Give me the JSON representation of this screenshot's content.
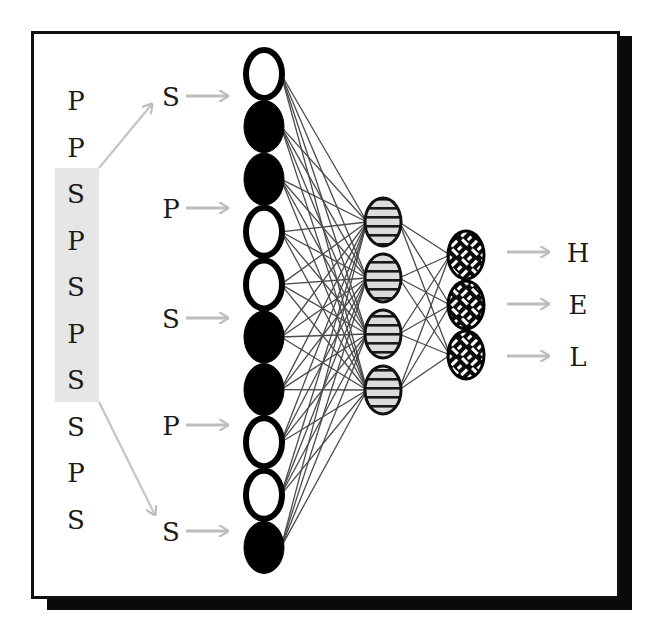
{
  "diagram": {
    "type": "neural-network-sliding-window",
    "input_sequence": [
      "P",
      "P",
      "S",
      "P",
      "S",
      "P",
      "S",
      "S",
      "P",
      "S"
    ],
    "window": {
      "start_index": 2,
      "end_index": 6,
      "letters": [
        "S",
        "P",
        "S",
        "P",
        "S"
      ],
      "highlight_color": "#e6e6e6"
    },
    "input_layer": {
      "node_count": 10,
      "nodes": [
        "empty",
        "filled",
        "filled",
        "empty",
        "empty",
        "filled",
        "filled",
        "empty",
        "empty",
        "filled"
      ]
    },
    "hidden_layer": {
      "node_count": 4,
      "pattern": "horizontal-stripes"
    },
    "output_layer": {
      "node_count": 3,
      "pattern": "crosshatch-weave",
      "labels": [
        "H",
        "E",
        "L"
      ]
    },
    "connections": {
      "input_to_hidden": "fully-connected",
      "hidden_to_output": "fully-connected"
    },
    "colors": {
      "frame": "#111111",
      "shadow": "#0a0a0a",
      "arrow": "#bdbdbd",
      "edge": "#4a4a4a",
      "node_fill_dark": "#000000",
      "node_fill_light": "#ffffff"
    }
  }
}
